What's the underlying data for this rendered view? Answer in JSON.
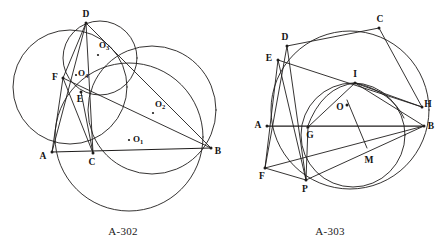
{
  "sheet": {
    "width": 443,
    "height": 251,
    "background": "#ffffff",
    "ink_color": "#1f1d1c"
  },
  "figures": [
    {
      "id": "A-302",
      "caption": "A-302",
      "caption_x": 123,
      "caption_y": 235,
      "description": "Triangle ABD with point C on AB, cevians and four circles with centers O1, O2, O3, O4",
      "points": [
        {
          "name": "A",
          "label": "A",
          "x": 52,
          "y": 152,
          "label_dx": -9,
          "label_dy": 5,
          "dot": true
        },
        {
          "name": "B",
          "label": "B",
          "x": 211,
          "y": 148,
          "label_dx": 7,
          "label_dy": 4,
          "dot": true
        },
        {
          "name": "C",
          "label": "C",
          "x": 93,
          "y": 153,
          "label_dx": -1,
          "label_dy": 10,
          "dot": true
        },
        {
          "name": "D",
          "label": "D",
          "x": 86,
          "y": 23,
          "label_dx": 0,
          "label_dy": -8,
          "dot": true
        },
        {
          "name": "E",
          "label": "E",
          "x": 81,
          "y": 92,
          "label_dx": -1,
          "label_dy": 8,
          "dot": true
        },
        {
          "name": "F",
          "label": "F",
          "x": 63,
          "y": 78,
          "label_dx": -8,
          "label_dy": 0,
          "dot": true
        }
      ],
      "centers": [
        {
          "name": "O1",
          "base": "O",
          "sub": "1",
          "x": 129,
          "y": 140,
          "label_dx": 4,
          "label_dy": 0
        },
        {
          "name": "O2",
          "base": "O",
          "sub": "2",
          "x": 153,
          "y": 113,
          "label_dx": 2,
          "label_dy": -8
        },
        {
          "name": "O3",
          "base": "O",
          "sub": "3",
          "x": 98,
          "y": 55,
          "label_dx": 1,
          "label_dy": -9
        },
        {
          "name": "O4",
          "base": "O",
          "sub": "4",
          "x": 76,
          "y": 75,
          "label_dx": 2,
          "label_dy": -1
        }
      ],
      "circles": [
        {
          "name": "circle-O-left",
          "cx": 70,
          "cy": 87,
          "r": 57
        },
        {
          "name": "circle-O3-small",
          "cx": 100,
          "cy": 58,
          "r": 37
        },
        {
          "name": "circle-O1-big",
          "cx": 129,
          "cy": 137,
          "r": 74
        },
        {
          "name": "circle-O2-right",
          "cx": 152,
          "cy": 110,
          "r": 64
        }
      ],
      "segments": [
        {
          "name": "side-AB",
          "x1": 52,
          "y1": 152,
          "x2": 211,
          "y2": 148,
          "bold": true
        },
        {
          "name": "side-AD",
          "x1": 52,
          "y1": 152,
          "x2": 86,
          "y2": 23,
          "bold": false
        },
        {
          "name": "side-DB",
          "x1": 86,
          "y1": 23,
          "x2": 211,
          "y2": 148,
          "bold": false
        },
        {
          "name": "cevian-DC",
          "x1": 86,
          "y1": 23,
          "x2": 93,
          "y2": 153,
          "bold": false
        },
        {
          "name": "segment-DF",
          "x1": 86,
          "y1": 23,
          "x2": 63,
          "y2": 78,
          "bold": false
        },
        {
          "name": "segment-FB",
          "x1": 63,
          "y1": 78,
          "x2": 211,
          "y2": 148,
          "bold": false
        },
        {
          "name": "segment-FC",
          "x1": 63,
          "y1": 78,
          "x2": 93,
          "y2": 153,
          "bold": false
        },
        {
          "name": "segment-FA",
          "x1": 63,
          "y1": 78,
          "x2": 52,
          "y2": 152,
          "bold": false
        },
        {
          "name": "segment-EC",
          "x1": 81,
          "y1": 92,
          "x2": 93,
          "y2": 153,
          "bold": false
        }
      ]
    },
    {
      "id": "A-303",
      "caption": "A-303",
      "caption_x": 330,
      "caption_y": 235,
      "description": "Cyclic polygon D C H B P with chords, inner circle through I G P, center O and point M",
      "points": [
        {
          "name": "A",
          "label": "A",
          "x": 267,
          "y": 126,
          "label_dx": -9,
          "label_dy": 0,
          "dot": true
        },
        {
          "name": "B",
          "label": "B",
          "x": 424,
          "y": 126,
          "label_dx": 7,
          "label_dy": 1,
          "dot": true
        },
        {
          "name": "C",
          "label": "C",
          "x": 379,
          "y": 28,
          "label_dx": 1,
          "label_dy": -8,
          "dot": true
        },
        {
          "name": "D",
          "label": "D",
          "x": 287,
          "y": 46,
          "label_dx": -2,
          "label_dy": -8,
          "dot": true
        },
        {
          "name": "E",
          "label": "E",
          "x": 278,
          "y": 60,
          "label_dx": -9,
          "label_dy": -1,
          "dot": true
        },
        {
          "name": "F",
          "label": "F",
          "x": 265,
          "y": 168,
          "label_dx": -3,
          "label_dy": 9,
          "dot": true
        },
        {
          "name": "G",
          "label": "G",
          "x": 308,
          "y": 127,
          "label_dx": 2,
          "label_dy": 9,
          "dot": true
        },
        {
          "name": "H",
          "label": "H",
          "x": 422,
          "y": 107,
          "label_dx": 6,
          "label_dy": -2,
          "dot": true
        },
        {
          "name": "I",
          "label": "I",
          "x": 355,
          "y": 83,
          "label_dx": 0,
          "label_dy": -8,
          "dot": true
        },
        {
          "name": "M",
          "label": "M",
          "x": 368,
          "y": 152,
          "label_dx": 1,
          "label_dy": 9,
          "dot": false
        },
        {
          "name": "P",
          "label": "P",
          "x": 306,
          "y": 180,
          "label_dx": -1,
          "label_dy": 10,
          "dot": true
        },
        {
          "name": "O",
          "label": "O",
          "x": 347,
          "y": 105,
          "label_dx": -7,
          "label_dy": 3,
          "dot": true
        }
      ],
      "circles": [
        {
          "name": "circle-outer",
          "cx": 350,
          "cy": 110,
          "r": 79
        },
        {
          "name": "circle-inner",
          "cx": 353,
          "cy": 135,
          "r": 52
        }
      ],
      "arcs": [
        {
          "name": "arc-GIP",
          "d": "M 307 128 Q 322 86 356 83 Q 392 92 404 118"
        }
      ],
      "segments": [
        {
          "name": "chord-AB",
          "x1": 267,
          "y1": 126,
          "x2": 424,
          "y2": 126,
          "bold": true
        },
        {
          "name": "chord-DC",
          "x1": 287,
          "y1": 46,
          "x2": 379,
          "y2": 28,
          "bold": false
        },
        {
          "name": "chord-CH",
          "x1": 379,
          "y1": 28,
          "x2": 422,
          "y2": 107,
          "bold": false
        },
        {
          "name": "chord-EH",
          "x1": 278,
          "y1": 60,
          "x2": 422,
          "y2": 107,
          "bold": false
        },
        {
          "name": "chord-DP",
          "x1": 287,
          "y1": 46,
          "x2": 306,
          "y2": 180,
          "bold": false
        },
        {
          "name": "chord-EP",
          "x1": 278,
          "y1": 60,
          "x2": 306,
          "y2": 180,
          "bold": false
        },
        {
          "name": "chord-EF",
          "x1": 278,
          "y1": 60,
          "x2": 265,
          "y2": 168,
          "bold": false
        },
        {
          "name": "chord-DF",
          "x1": 287,
          "y1": 46,
          "x2": 265,
          "y2": 168,
          "bold": false
        },
        {
          "name": "chord-FP",
          "x1": 265,
          "y1": 168,
          "x2": 306,
          "y2": 180,
          "bold": false
        },
        {
          "name": "chord-FB",
          "x1": 265,
          "y1": 168,
          "x2": 424,
          "y2": 126,
          "bold": false
        },
        {
          "name": "chord-PB",
          "x1": 306,
          "y1": 180,
          "x2": 424,
          "y2": 126,
          "bold": false
        },
        {
          "name": "chord-GI",
          "x1": 308,
          "y1": 127,
          "x2": 355,
          "y2": 83,
          "bold": false
        },
        {
          "name": "chord-IB",
          "x1": 355,
          "y1": 83,
          "x2": 424,
          "y2": 126,
          "bold": false
        },
        {
          "name": "chord-IH",
          "x1": 355,
          "y1": 83,
          "x2": 422,
          "y2": 107,
          "bold": false
        },
        {
          "name": "chord-GP",
          "x1": 308,
          "y1": 127,
          "x2": 306,
          "y2": 180,
          "bold": false
        },
        {
          "name": "segment-OM",
          "x1": 347,
          "y1": 100,
          "x2": 367,
          "y2": 148,
          "bold": false
        }
      ]
    }
  ]
}
